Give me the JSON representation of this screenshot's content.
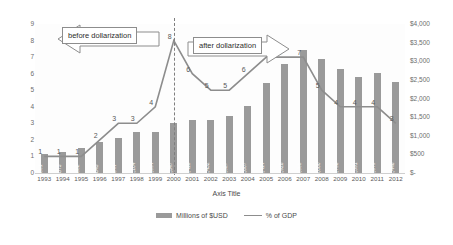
{
  "chart_data": {
    "type": "bar",
    "title": "",
    "xlabel": "Axis Title",
    "ylabel": "",
    "categories": [
      "1993",
      "1994",
      "1995",
      "1996",
      "1997",
      "1998",
      "1999",
      "2000",
      "2001",
      "2002",
      "2003",
      "2004",
      "2005",
      "2006",
      "2007",
      "2008",
      "2009",
      "2010",
      "2011",
      "2012"
    ],
    "ylim": [
      0,
      9
    ],
    "y2lim": [
      0,
      4000
    ],
    "grid": false,
    "legend_position": "bottom",
    "y_ticks": [
      "0",
      "1",
      "2",
      "3",
      "4",
      "5",
      "6",
      "7",
      "8",
      "9"
    ],
    "y2_ticks": [
      "$-",
      "$500",
      "$1,000",
      "$1,500",
      "$2,000",
      "$2,500",
      "$3,000",
      "$3,500",
      "$4,000"
    ],
    "series": [
      {
        "name": "Millions of $USD",
        "type": "bar",
        "axis": "right",
        "color": "#9a9a9a",
        "values": [
          501,
          573,
          682,
          845,
          944,
          1104,
          1094,
          1347,
          1415,
          1432,
          1527,
          1807,
          2414,
          2928,
          3305,
          3060,
          2798,
          2591,
          2679,
          2446
        ],
        "labels": [
          "$501",
          "$573",
          "$682",
          "$845",
          "$944",
          "$1,104",
          "$1,094",
          "$1,347",
          "$1,415",
          "$1,432",
          "$1,527",
          "$1,807",
          "$2,414",
          "$2,928",
          "$3,305",
          "$3,060",
          "$2,798",
          "$2,591",
          "$2,679",
          "$2,446"
        ]
      },
      {
        "name": "% of GDP",
        "type": "line",
        "axis": "left",
        "color": "#8d8d8d",
        "values": [
          1,
          1,
          1,
          2,
          3,
          3,
          4,
          8,
          6,
          5,
          5,
          6,
          7,
          7,
          7,
          5,
          4,
          4,
          4,
          3
        ],
        "labels": [
          "1",
          "1",
          "1",
          "2",
          "3",
          "3",
          "4",
          "8",
          "6",
          "5",
          "5",
          "6",
          "7",
          "7",
          "7",
          "5",
          "4",
          "4",
          "4",
          "3"
        ]
      }
    ],
    "annotations": [
      {
        "text": "before dollarization",
        "direction": "left"
      },
      {
        "text": "after dollarization",
        "direction": "right"
      }
    ],
    "divider": {
      "at_category": "2000",
      "style": "dashed"
    }
  }
}
